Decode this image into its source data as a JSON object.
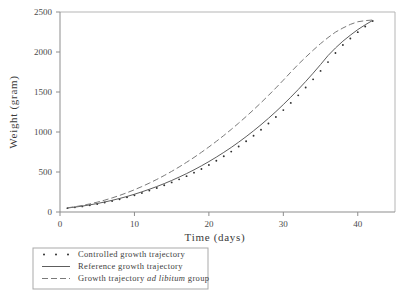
{
  "chart_data": {
    "type": "line",
    "title": "",
    "xlabel": "Time (days)",
    "ylabel": "Weight (gram)",
    "xlim": [
      0,
      45
    ],
    "ylim": [
      0,
      2500
    ],
    "xticks": [
      0,
      10,
      20,
      30,
      40
    ],
    "yticks": [
      0,
      500,
      1000,
      1500,
      2000,
      2500
    ],
    "grid": false,
    "legend_position": "below-axes-left",
    "x": [
      1,
      2,
      3,
      4,
      5,
      6,
      7,
      8,
      9,
      10,
      11,
      12,
      13,
      14,
      15,
      16,
      17,
      18,
      19,
      20,
      21,
      22,
      23,
      24,
      25,
      26,
      27,
      28,
      29,
      30,
      31,
      32,
      33,
      34,
      35,
      36,
      37,
      38,
      39,
      40,
      41,
      42
    ],
    "series": [
      {
        "name": "Controlled growth trajectory",
        "style": "dotted",
        "marker": "dot",
        "values": [
          48,
          58,
          70,
          84,
          100,
          118,
          138,
          160,
          184,
          210,
          238,
          268,
          300,
          334,
          370,
          408,
          448,
          492,
          538,
          588,
          640,
          696,
          755,
          818,
          884,
          954,
          1028,
          1106,
          1188,
          1274,
          1364,
          1458,
          1556,
          1658,
          1764,
          1874,
          1988,
          2088,
          2168,
          2248,
          2318,
          2388
        ]
      },
      {
        "name": "Reference growth trajectory",
        "style": "solid",
        "marker": "none",
        "values": [
          50,
          61,
          74,
          89,
          106,
          125,
          146,
          169,
          194,
          222,
          252,
          284,
          318,
          355,
          394,
          436,
          480,
          527,
          577,
          630,
          686,
          745,
          807,
          873,
          942,
          1015,
          1091,
          1171,
          1255,
          1343,
          1435,
          1531,
          1631,
          1735,
          1843,
          1955,
          2050,
          2135,
          2210,
          2280,
          2340,
          2395
        ]
      },
      {
        "name": "Growth trajectory ad libitum group",
        "style": "dashed",
        "marker": "none",
        "values": [
          52,
          66,
          82,
          101,
          123,
          148,
          176,
          207,
          241,
          278,
          318,
          361,
          407,
          456,
          508,
          563,
          621,
          682,
          746,
          813,
          883,
          956,
          1032,
          1111,
          1193,
          1278,
          1366,
          1457,
          1551,
          1648,
          1748,
          1845,
          1935,
          2022,
          2105,
          2180,
          2248,
          2300,
          2345,
          2378,
          2392,
          2400
        ]
      }
    ],
    "legend": [
      {
        "label_plain": "Controlled growth trajectory",
        "sample": "dots",
        "parts": [
          {
            "text": "Controlled growth trajectory",
            "italic": false
          }
        ]
      },
      {
        "label_plain": "Reference growth trajectory",
        "sample": "solid-line",
        "parts": [
          {
            "text": "Reference growth trajectory",
            "italic": false
          }
        ]
      },
      {
        "label_plain": "Growth trajectory ad libitum group",
        "sample": "dashed-line",
        "parts": [
          {
            "text": "Growth trajectory ",
            "italic": false
          },
          {
            "text": "ad libitum",
            "italic": true
          },
          {
            "text": " group",
            "italic": false
          }
        ]
      }
    ],
    "colors": {
      "axis": "#8d8d8d",
      "frame": "#b5b5b5",
      "solid_series": "#5d5d5d",
      "dashed_series": "#7a7a7a",
      "dotted_series": "#2e2e2e",
      "text": "#3a3a3a",
      "background": "#ffffff"
    }
  }
}
